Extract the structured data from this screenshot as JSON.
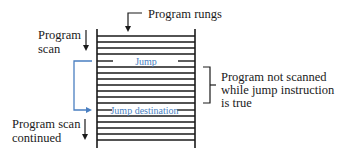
{
  "diagram": {
    "title_callout": "Program rungs",
    "left_labels": {
      "scan_line1": "Program",
      "scan_line2": "scan",
      "continued_line1": "Program scan",
      "continued_line2": "continued"
    },
    "ladder": {
      "rung_count": 18,
      "jump_label": "Jump",
      "jump_destination_label": "Jump destination"
    },
    "right_note": {
      "line1": "Program not scanned",
      "line2": "while jump instruction",
      "line3": "is true"
    },
    "colors": {
      "ink": "#1a1a1a",
      "jump_blue": "#4a7fc1",
      "background": "#ffffff"
    }
  }
}
